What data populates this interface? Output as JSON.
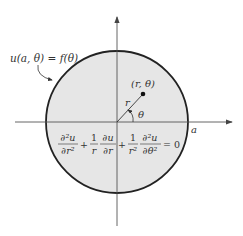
{
  "diagram": {
    "boundary_label": "u(a, θ) = f(θ)",
    "point_label": "(r, θ)",
    "radius_label": "r",
    "angle_label": "θ",
    "radius_value_label": "a",
    "equation": {
      "term1_num": "∂²u",
      "term1_den": "∂r²",
      "plus1": "+",
      "term2_coef_num": "1",
      "term2_coef_den": "r",
      "term2_num": "∂u",
      "term2_den": "∂r",
      "plus2": "+",
      "term3_coef_num": "1",
      "term3_coef_den": "r²",
      "term3_num": "∂²u",
      "term3_den": "∂θ²",
      "equals": "= 0"
    },
    "colors": {
      "disk_fill": "#e6e6e6",
      "boundary": "#222222",
      "axes": "#555555"
    }
  }
}
